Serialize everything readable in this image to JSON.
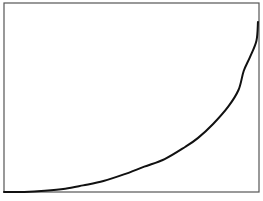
{
  "chart_data": {
    "type": "line",
    "title": "",
    "xlabel": "",
    "ylabel": "",
    "grid": false,
    "legend": null,
    "xlim": [
      0,
      1
    ],
    "ylim": [
      0,
      1
    ],
    "series": [
      {
        "name": "curve",
        "color": "#111111",
        "x": [
          0.0,
          0.08,
          0.16,
          0.24,
          0.31,
          0.39,
          0.47,
          0.55,
          0.63,
          0.71,
          0.76,
          0.82,
          0.88,
          0.92,
          0.94,
          0.965,
          0.99,
          0.996
        ],
        "y": [
          0.0,
          0.0,
          0.006,
          0.017,
          0.035,
          0.058,
          0.093,
          0.134,
          0.174,
          0.238,
          0.285,
          0.36,
          0.453,
          0.541,
          0.64,
          0.715,
          0.8,
          0.9
        ]
      }
    ]
  },
  "plot": {
    "frame_color": "#555555",
    "background": "#ffffff",
    "frame": {
      "left": 4,
      "top": 3,
      "right": 259,
      "bottom": 192
    }
  }
}
